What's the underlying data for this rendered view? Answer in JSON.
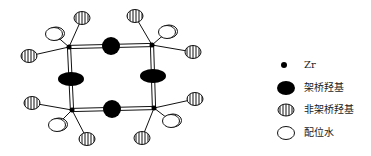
{
  "diagram": {
    "type": "zirconium-tetramer-structure",
    "colors": {
      "stroke": "#111111",
      "fill_bridging": "#000000",
      "background": "#ffffff"
    },
    "zr_atoms": [
      {
        "id": "zr-top-left",
        "x": 69,
        "y": 47
      },
      {
        "id": "zr-top-right",
        "x": 152,
        "y": 45
      },
      {
        "id": "zr-bottom-left",
        "x": 72,
        "y": 110
      },
      {
        "id": "zr-bottom-right",
        "x": 154,
        "y": 108
      }
    ],
    "bridging_hydroxyls": [
      {
        "id": "bridge-top",
        "x": 111,
        "y": 46,
        "rx": 9,
        "ry": 9
      },
      {
        "id": "bridge-bottom",
        "x": 112,
        "y": 109,
        "rx": 9,
        "ry": 9
      },
      {
        "id": "bridge-left",
        "x": 71,
        "y": 79,
        "rx": 13,
        "ry": 7
      },
      {
        "id": "bridge-right",
        "x": 153,
        "y": 76,
        "rx": 13,
        "ry": 7
      }
    ],
    "terminal_hydroxyls": [
      {
        "id": "oh-tl-top",
        "x": 82,
        "y": 18,
        "zr": 0
      },
      {
        "id": "oh-tl-left",
        "x": 29,
        "y": 56,
        "zr": 0
      },
      {
        "id": "oh-tr-top",
        "x": 135,
        "y": 16,
        "zr": 1
      },
      {
        "id": "oh-tr-right",
        "x": 193,
        "y": 52,
        "zr": 1
      },
      {
        "id": "oh-bl-left",
        "x": 32,
        "y": 103,
        "zr": 2
      },
      {
        "id": "oh-bl-bottom",
        "x": 87,
        "y": 139,
        "zr": 2
      },
      {
        "id": "oh-br-right",
        "x": 195,
        "y": 99,
        "zr": 3
      },
      {
        "id": "oh-br-bottom",
        "x": 142,
        "y": 138,
        "zr": 3
      }
    ],
    "coordinated_water": [
      {
        "id": "h2o-tl",
        "x": 54,
        "y": 34,
        "zr": 0
      },
      {
        "id": "h2o-tr",
        "x": 167,
        "y": 32,
        "zr": 1
      },
      {
        "id": "h2o-bl",
        "x": 57,
        "y": 125,
        "zr": 2
      },
      {
        "id": "h2o-br",
        "x": 171,
        "y": 121,
        "zr": 3
      }
    ]
  },
  "legend": {
    "items": [
      {
        "symbol": "zr-dot",
        "label": "Zr"
      },
      {
        "symbol": "filled-ellipse",
        "label": "架桥羟基"
      },
      {
        "symbol": "striped-ellipse",
        "label": "非架桥羟基"
      },
      {
        "symbol": "open-ellipse",
        "label": "配位水"
      }
    ]
  }
}
